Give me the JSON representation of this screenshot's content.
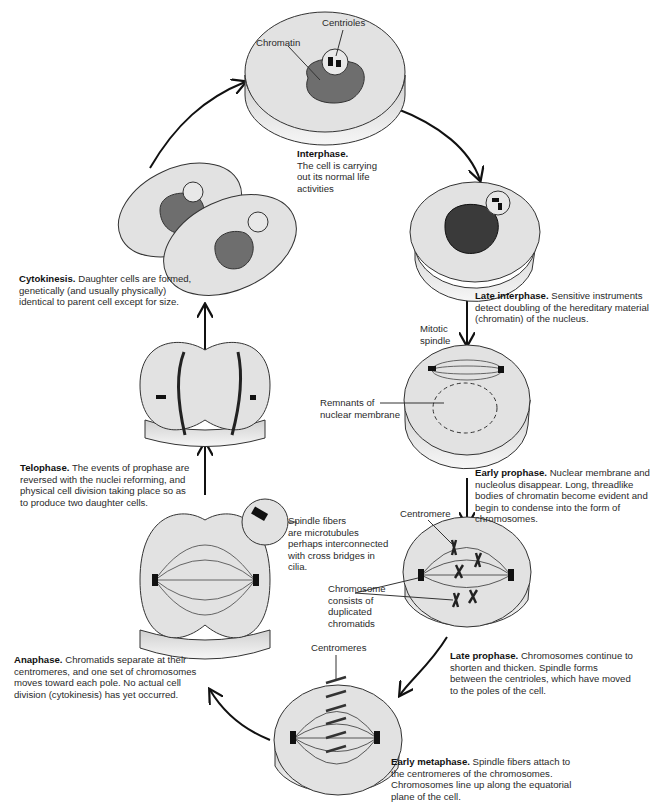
{
  "colors": {
    "cell_top": "#e2e2e2",
    "cell_side": "#f4f4f4",
    "nucleus": "#6e6e6e",
    "outline": "#333333",
    "dark": "#111111"
  },
  "stages": [
    {
      "id": "interphase",
      "name": "Interphase.",
      "text": [
        "The cell is carrying",
        "out its normal life",
        "activities"
      ]
    },
    {
      "id": "late-interphase",
      "name": "Late interphase.",
      "text": [
        "Sensitive instruments",
        "detect doubling of the hereditary material",
        "(chromatin) of the nucleus."
      ]
    },
    {
      "id": "early-prophase",
      "name": "Early prophase.",
      "text": [
        "Nuclear membrane and",
        "nucleolus disappear.  Long, threadlike",
        "bodies of chromatin become evident and",
        "begin to condense into the form of",
        "chromosomes."
      ]
    },
    {
      "id": "late-prophase",
      "name": "Late prophase.",
      "text": [
        "Chromosomes continue to",
        "shorten and thicken.  Spindle forms",
        "between the centrioles, which have moved",
        "to the poles of the cell."
      ]
    },
    {
      "id": "early-metaphase",
      "name": "Early metaphase.",
      "text": [
        "Spindle fibers attach to",
        "the centromeres of the chromosomes.",
        "Chromosomes line up along the equatorial",
        "plane of the cell."
      ]
    },
    {
      "id": "anaphase",
      "name": "Anaphase.",
      "text": [
        "Chromatids separate at their",
        "centromeres, and one set of chromosomes",
        "moves toward each pole.  No actual cell",
        "division (cytokinesis) has yet occurred."
      ]
    },
    {
      "id": "telophase",
      "name": "Telophase.",
      "text": [
        "The events of prophase are",
        "reversed with the nuclei reforming, and",
        "physical cell division taking place so as",
        "to produce two daughter cells."
      ]
    },
    {
      "id": "cytokinesis",
      "name": "Cytokinesis.",
      "text": [
        "Daughter cells are formed,",
        "genetically (and usually physically)",
        "identical to parent cell except for size."
      ]
    }
  ],
  "labels": {
    "centrioles": "Centrioles",
    "chromatin": "Chromatin",
    "mitotic_spindle": [
      "Mitotic",
      "spindle"
    ],
    "remnants": [
      "Remnants of",
      "nuclear membrane"
    ],
    "centromere": "Centromere",
    "chromosome": [
      "Chromosome",
      "consists of",
      "duplicated",
      "chromatids"
    ],
    "centromeres": "Centromeres",
    "spindle_fibers": [
      "Spindle fibers",
      "are microtubules",
      "perhaps interconnected",
      "with cross bridges in",
      "cilia."
    ]
  }
}
